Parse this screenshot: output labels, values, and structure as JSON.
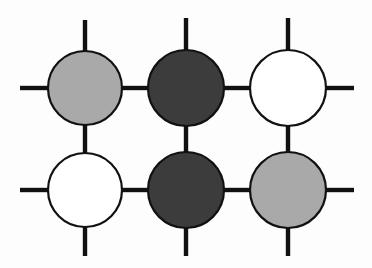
{
  "figure": {
    "type": "node-link-diagram",
    "width": 372,
    "height": 268,
    "background_color": "#fdfdfd"
  },
  "style": {
    "edge_color": "#111111",
    "edge_width": 4.4,
    "node_stroke_color": "#111111",
    "node_stroke_width": 2.2,
    "node_radius": 37,
    "fill_light_gray": "#a9a9a9",
    "fill_dark_gray": "#3c3c3c",
    "fill_white": "#ffffff"
  },
  "grid": {
    "columns_x": [
      85,
      186,
      288
    ],
    "rows_y": [
      88,
      190
    ],
    "column_count": 3,
    "row_count": 2
  },
  "nodes": [
    {
      "id": "n-r1c1",
      "label": "",
      "row": 1,
      "col": 1,
      "cx": 85,
      "cy": 88,
      "r": 37,
      "fill": "#a9a9a9",
      "shade": "light-gray"
    },
    {
      "id": "n-r1c2",
      "label": "",
      "row": 1,
      "col": 2,
      "cx": 186,
      "cy": 88,
      "r": 38,
      "fill": "#3c3c3c",
      "shade": "dark-gray"
    },
    {
      "id": "n-r1c3",
      "label": "",
      "row": 1,
      "col": 3,
      "cx": 288,
      "cy": 88,
      "r": 38,
      "fill": "#ffffff",
      "shade": "white"
    },
    {
      "id": "n-r2c1",
      "label": "",
      "row": 2,
      "col": 1,
      "cx": 85,
      "cy": 190,
      "r": 37,
      "fill": "#ffffff",
      "shade": "white"
    },
    {
      "id": "n-r2c2",
      "label": "",
      "row": 2,
      "col": 2,
      "cx": 186,
      "cy": 190,
      "r": 38,
      "fill": "#3c3c3c",
      "shade": "dark-gray"
    },
    {
      "id": "n-r2c3",
      "label": "",
      "row": 2,
      "col": 3,
      "cx": 288,
      "cy": 190,
      "r": 38,
      "fill": "#a9a9a9",
      "shade": "light-gray"
    }
  ],
  "edges": [
    {
      "id": "e-r1c1-r1c2",
      "kind": "horizontal-internal",
      "x1": 122,
      "y1": 88,
      "x2": 148,
      "y2": 88
    },
    {
      "id": "e-r1c2-r1c3",
      "kind": "horizontal-internal",
      "x1": 224,
      "y1": 88,
      "x2": 250,
      "y2": 88
    },
    {
      "id": "e-r2c1-r2c2",
      "kind": "horizontal-internal",
      "x1": 122,
      "y1": 190,
      "x2": 148,
      "y2": 190
    },
    {
      "id": "e-r2c2-r2c3",
      "kind": "horizontal-internal",
      "x1": 224,
      "y1": 190,
      "x2": 250,
      "y2": 190
    },
    {
      "id": "e-r1c1-r2c1",
      "kind": "vertical-internal",
      "x1": 85,
      "y1": 125,
      "x2": 85,
      "y2": 153
    },
    {
      "id": "e-r1c2-r2c2",
      "kind": "vertical-internal",
      "x1": 186,
      "y1": 126,
      "x2": 186,
      "y2": 152
    },
    {
      "id": "e-r1c3-r2c3",
      "kind": "vertical-internal",
      "x1": 288,
      "y1": 126,
      "x2": 288,
      "y2": 152
    },
    {
      "id": "e-stub-left-r1",
      "kind": "stub-left",
      "x1": 20,
      "y1": 88,
      "x2": 48,
      "y2": 88
    },
    {
      "id": "e-stub-left-r2",
      "kind": "stub-left",
      "x1": 20,
      "y1": 190,
      "x2": 48,
      "y2": 190
    },
    {
      "id": "e-stub-right-r1",
      "kind": "stub-right",
      "x1": 326,
      "y1": 88,
      "x2": 354,
      "y2": 88
    },
    {
      "id": "e-stub-right-r2",
      "kind": "stub-right",
      "x1": 326,
      "y1": 190,
      "x2": 354,
      "y2": 190
    },
    {
      "id": "e-stub-top-c1",
      "kind": "stub-top",
      "x1": 85,
      "y1": 20,
      "x2": 85,
      "y2": 51
    },
    {
      "id": "e-stub-top-c2",
      "kind": "stub-top",
      "x1": 186,
      "y1": 18,
      "x2": 186,
      "y2": 50
    },
    {
      "id": "e-stub-top-c3",
      "kind": "stub-top",
      "x1": 288,
      "y1": 18,
      "x2": 288,
      "y2": 50
    },
    {
      "id": "e-stub-bottom-c1",
      "kind": "stub-bottom",
      "x1": 85,
      "y1": 227,
      "x2": 85,
      "y2": 256
    },
    {
      "id": "e-stub-bottom-c2",
      "kind": "stub-bottom",
      "x1": 186,
      "y1": 228,
      "x2": 186,
      "y2": 256
    },
    {
      "id": "e-stub-bottom-c3",
      "kind": "stub-bottom",
      "x1": 288,
      "y1": 228,
      "x2": 288,
      "y2": 256
    }
  ]
}
